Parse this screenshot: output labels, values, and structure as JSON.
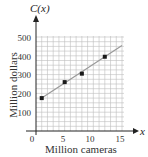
{
  "chart_data": {
    "type": "scatter",
    "title": "",
    "function_label": "C(x)",
    "x_variable": "x",
    "xlabel": "Million cameras",
    "ylabel": "Million dollars",
    "xlim": [
      0,
      15
    ],
    "ylim": [
      0,
      500
    ],
    "x_ticks": [
      0,
      5,
      10,
      15
    ],
    "x_tick_labels": [
      "0",
      "5",
      "10",
      "15"
    ],
    "y_ticks": [
      100,
      200,
      300,
      400,
      500
    ],
    "y_tick_labels": [
      "100",
      "200",
      "300",
      "400",
      "500"
    ],
    "grid": true,
    "grid_x_step": 1,
    "grid_y_step": 25,
    "legend": null,
    "series": [
      {
        "name": "Data points",
        "type": "scatter",
        "x": [
          1,
          5,
          8,
          12
        ],
        "y": [
          175,
          260,
          305,
          395
        ]
      },
      {
        "name": "Regression line",
        "type": "line",
        "x": [
          1,
          15
        ],
        "y": [
          175,
          455
        ]
      }
    ],
    "colors": {
      "grid": "#bdbdbd",
      "axis": "#222222",
      "points": "#1a1a1a",
      "line": "#9a9a9a"
    }
  }
}
